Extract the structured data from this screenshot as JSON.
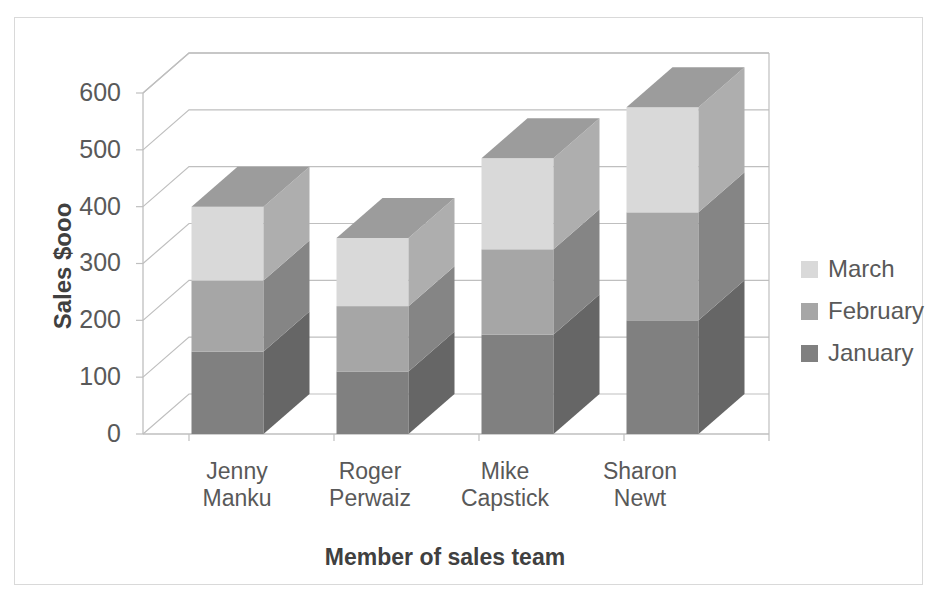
{
  "chart_data": {
    "type": "bar",
    "subtype": "stacked-column-3d",
    "title": "",
    "xlabel": "Member of sales team",
    "ylabel": "Sales $ooo",
    "categories": [
      "Jenny Manku",
      "Roger Perwaiz",
      "Mike Capstick",
      "Sharon Newt"
    ],
    "category_lines": [
      [
        "Jenny",
        "Manku"
      ],
      [
        "Roger",
        "Perwaiz"
      ],
      [
        "Mike",
        "Capstick"
      ],
      [
        "Sharon",
        "Newt"
      ]
    ],
    "series": [
      {
        "name": "January",
        "color": "#808080",
        "values": [
          145,
          110,
          175,
          200
        ]
      },
      {
        "name": "February",
        "color": "#a6a6a6",
        "values": [
          125,
          115,
          150,
          190
        ]
      },
      {
        "name": "March",
        "color": "#d9d9d9",
        "values": [
          130,
          120,
          160,
          185
        ]
      }
    ],
    "totals": [
      400,
      345,
      485,
      575
    ],
    "ylim": [
      0,
      600
    ],
    "yticks": [
      0,
      100,
      200,
      300,
      400,
      500,
      600
    ],
    "ytick_labels": [
      "0",
      "100",
      "200",
      "300",
      "400",
      "500",
      "600"
    ],
    "grid": true,
    "legend_position": "right",
    "legend_order": [
      "March",
      "February",
      "January"
    ],
    "axis_color": "#bfbfbf",
    "text_color": "#595959",
    "title_color": "#404040",
    "plot_background": "#ffffff",
    "border_color": "#d9d9d9"
  }
}
